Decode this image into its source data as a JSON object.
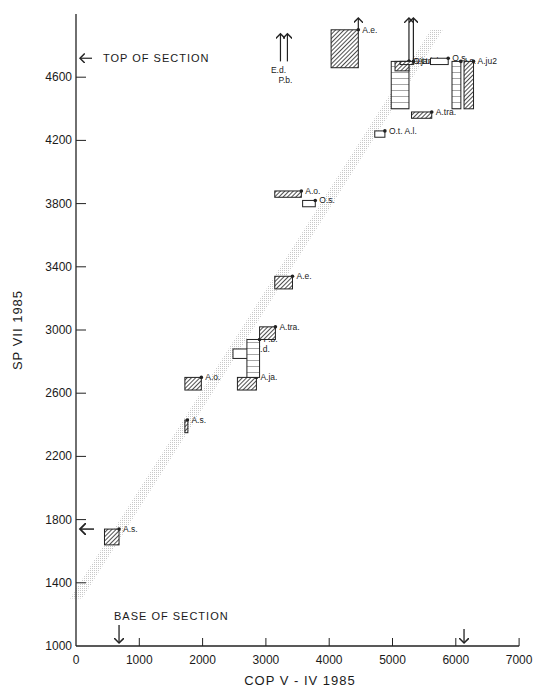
{
  "chart_data": {
    "type": "scatter",
    "title": "",
    "xlabel": "COP V - IV 1985",
    "ylabel": "SP VII 1985",
    "xlim": [
      0,
      7000
    ],
    "ylim": [
      1000,
      4900
    ],
    "x_ticks": [
      0,
      1000,
      2000,
      3000,
      4000,
      5000,
      6000,
      7000
    ],
    "y_ticks": [
      1000,
      1400,
      1800,
      2200,
      2600,
      3000,
      3400,
      3800,
      4200,
      4600
    ],
    "grid": false,
    "legend": null,
    "annotations": [
      {
        "text": "TOP OF SECTION",
        "axis": "y",
        "value": 4720
      },
      {
        "text": "BASE OF SECTION",
        "axis": "x",
        "value": 680
      },
      {
        "text": "",
        "axis": "y",
        "value": 1740,
        "kind": "arrow"
      },
      {
        "text": "",
        "axis": "x",
        "value": 6130,
        "kind": "arrow"
      }
    ],
    "line_of_correlation": {
      "x": [
        0,
        5700
      ],
      "y": [
        1300,
        4900
      ],
      "style": "stippled band"
    },
    "series": [
      {
        "name": "A.s.",
        "x": [
          450,
          680
        ],
        "y": [
          1640,
          1740
        ],
        "fill": "hatched"
      },
      {
        "name": "A.s.",
        "x": [
          1720,
          1760
        ],
        "y": [
          2350,
          2430
        ],
        "fill": "hatched"
      },
      {
        "name": "A.o.",
        "x": [
          1720,
          1980
        ],
        "y": [
          2620,
          2700
        ],
        "fill": "hatched"
      },
      {
        "name": "A.ja.",
        "x": [
          2550,
          2850
        ],
        "y": [
          2620,
          2700
        ],
        "fill": "hatched"
      },
      {
        "name": "E.d.",
        "x": [
          2480,
          2760
        ],
        "y": [
          2820,
          2880
        ],
        "fill": "open"
      },
      {
        "name": "P.b.",
        "x": [
          2700,
          2900
        ],
        "y": [
          2700,
          2940
        ],
        "fill": "horizontal-lined"
      },
      {
        "name": "A.tra.",
        "x": [
          2900,
          3150
        ],
        "y": [
          2940,
          3020
        ],
        "fill": "hatched"
      },
      {
        "name": "A.e.",
        "x": [
          3140,
          3420
        ],
        "y": [
          3260,
          3340
        ],
        "fill": "hatched"
      },
      {
        "name": "A.o.",
        "x": [
          3140,
          3560
        ],
        "y": [
          3840,
          3880
        ],
        "fill": "hatched"
      },
      {
        "name": "O.s.",
        "x": [
          3580,
          3780
        ],
        "y": [
          3780,
          3820
        ],
        "fill": "open"
      },
      {
        "name": "O.t. A.l.",
        "x": [
          4720,
          4880
        ],
        "y": [
          4220,
          4260
        ],
        "fill": "open"
      },
      {
        "name": "A.tra.",
        "x": [
          5300,
          5620
        ],
        "y": [
          4340,
          4380
        ],
        "fill": "hatched"
      },
      {
        "name": "O.t. A.l.",
        "x": [
          4980,
          5260
        ],
        "y": [
          4400,
          4700
        ],
        "fill": "horizontal-lined"
      },
      {
        "name": "A.ja.",
        "x": [
          5040,
          5260
        ],
        "y": [
          4640,
          4700
        ],
        "fill": "hatched",
        "open_top": true
      },
      {
        "name": "A.tri.",
        "x": [
          5120,
          5330
        ],
        "y": [
          4680,
          4700
        ],
        "fill": "hatched",
        "open_top": true
      },
      {
        "name": "O.s.",
        "x": [
          5600,
          5880
        ],
        "y": [
          4680,
          4720
        ],
        "fill": "open"
      },
      {
        "name": "I.s.",
        "x": [
          5940,
          6080
        ],
        "y": [
          4400,
          4700
        ],
        "fill": "horizontal-lined"
      },
      {
        "name": "A.ju2",
        "x": [
          6130,
          6280
        ],
        "y": [
          4400,
          4700
        ],
        "fill": "hatched"
      },
      {
        "name": "E.d.",
        "x": [
          3230,
          3230
        ],
        "y": [
          4700,
          4900
        ],
        "fill": "line",
        "open_top": true
      },
      {
        "name": "P.b.",
        "x": [
          3340,
          3340
        ],
        "y": [
          4700,
          4900
        ],
        "fill": "line",
        "open_top": true
      },
      {
        "name": "A.e.",
        "x": [
          4030,
          4460
        ],
        "y": [
          4660,
          4900
        ],
        "fill": "hatched",
        "open_top": true
      }
    ]
  },
  "labels": {
    "top_of_section": "TOP OF SECTION",
    "base_of_section": "BASE OF SECTION",
    "xlabel": "COP V - IV 1985",
    "ylabel": "SP VII 1985"
  }
}
